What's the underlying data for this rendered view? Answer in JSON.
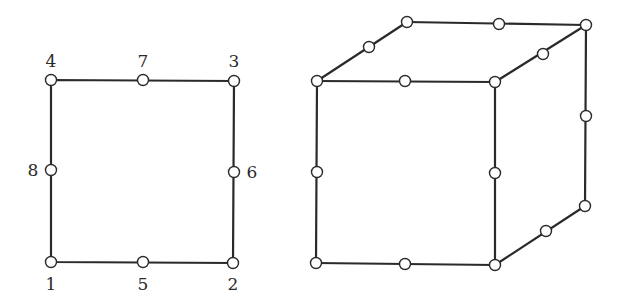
{
  "diagram": {
    "colors": {
      "line": "#2a2a2a",
      "node_fill": "#ffffff",
      "background": "#ffffff"
    },
    "quad": {
      "nodes": [
        {
          "id": "1",
          "label": "1",
          "x": 51,
          "y": 262,
          "lx": 51,
          "ly": 290
        },
        {
          "id": "2",
          "label": "2",
          "x": 233,
          "y": 263,
          "lx": 233,
          "ly": 290
        },
        {
          "id": "3",
          "label": "3",
          "x": 234,
          "y": 81,
          "lx": 234,
          "ly": 67
        },
        {
          "id": "4",
          "label": "4",
          "x": 51,
          "y": 80,
          "lx": 51,
          "ly": 67
        },
        {
          "id": "5",
          "label": "5",
          "x": 143,
          "y": 262,
          "lx": 143,
          "ly": 290
        },
        {
          "id": "6",
          "label": "6",
          "x": 234,
          "y": 172,
          "lx": 252,
          "ly": 178
        },
        {
          "id": "7",
          "label": "7",
          "x": 143,
          "y": 80,
          "lx": 143,
          "ly": 67
        },
        {
          "id": "8",
          "label": "8",
          "x": 51,
          "y": 170,
          "lx": 33,
          "ly": 176
        }
      ]
    },
    "hex": {
      "corners": {
        "front_tl": [
          317,
          81
        ],
        "front_tr": [
          495,
          82
        ],
        "front_br": [
          495,
          265
        ],
        "front_bl": [
          316,
          263
        ],
        "back_tl": [
          407,
          22
        ],
        "back_tr": [
          586,
          25
        ],
        "back_br": [
          585,
          206
        ]
      },
      "mid_nodes": [
        [
          405,
          81
        ],
        [
          317,
          172
        ],
        [
          495,
          173
        ],
        [
          405,
          264
        ],
        [
          369,
          47
        ],
        [
          499,
          24
        ],
        [
          543,
          54
        ],
        [
          586,
          116
        ],
        [
          546,
          231
        ]
      ]
    }
  }
}
